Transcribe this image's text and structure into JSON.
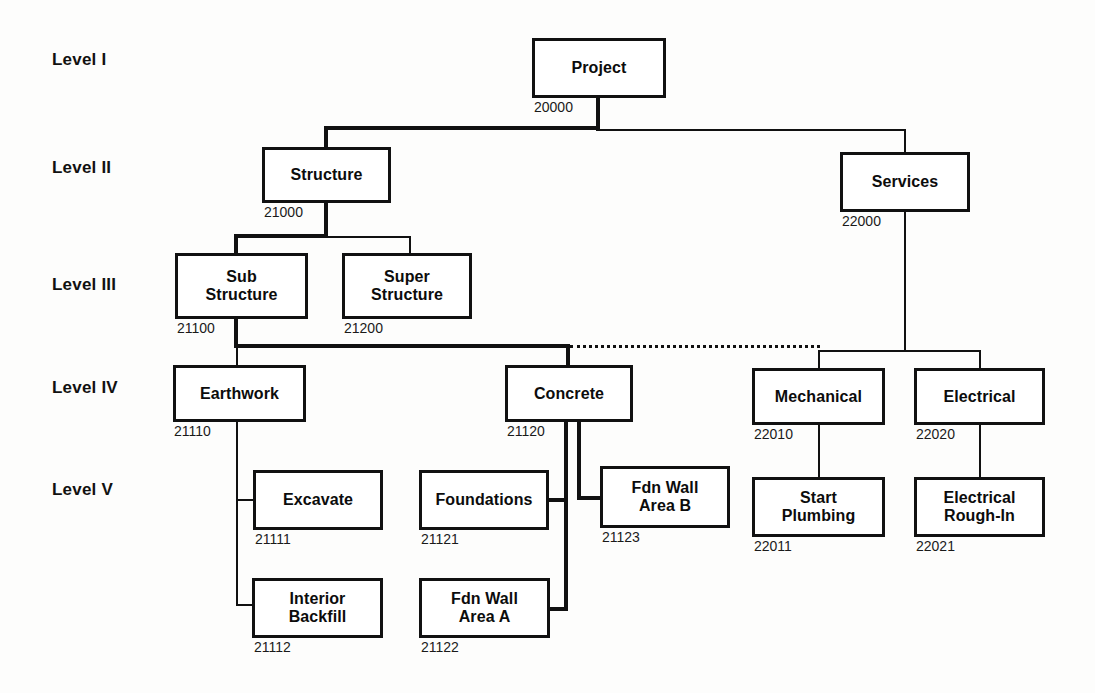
{
  "diagram": {
    "type": "hierarchy-tree",
    "line_color": "#111111",
    "box_border_color": "#111111",
    "box_fill_color": "#ffffff",
    "background_color": "#fdfdfc"
  },
  "levels": [
    {
      "label": "Level I"
    },
    {
      "label": "Level II"
    },
    {
      "label": "Level III"
    },
    {
      "label": "Level IV"
    },
    {
      "label": "Level V"
    }
  ],
  "nodes": [
    {
      "label": "Project",
      "code": "20000",
      "level": 1
    },
    {
      "label": "Structure",
      "code": "21000",
      "level": 2
    },
    {
      "label": "Services",
      "code": "22000",
      "level": 2
    },
    {
      "label": "Sub\nStructure",
      "code": "21100",
      "level": 3
    },
    {
      "label": "Super\nStructure",
      "code": "21200",
      "level": 3
    },
    {
      "label": "Earthwork",
      "code": "21110",
      "level": 4
    },
    {
      "label": "Concrete",
      "code": "21120",
      "level": 4
    },
    {
      "label": "Mechanical",
      "code": "22010",
      "level": 4
    },
    {
      "label": "Electrical",
      "code": "22020",
      "level": 4
    },
    {
      "label": "Excavate",
      "code": "21111",
      "level": 5
    },
    {
      "label": "Interior\nBackfill",
      "code": "21112",
      "level": 5
    },
    {
      "label": "Foundations",
      "code": "21121",
      "level": 5
    },
    {
      "label": "Fdn Wall\nArea A",
      "code": "21122",
      "level": 5
    },
    {
      "label": "Fdn Wall\nArea B",
      "code": "21123",
      "level": 5
    },
    {
      "label": "Start\nPlumbing",
      "code": "22011",
      "level": 5
    },
    {
      "label": "Electrical\nRough-In",
      "code": "22021",
      "level": 5
    }
  ]
}
